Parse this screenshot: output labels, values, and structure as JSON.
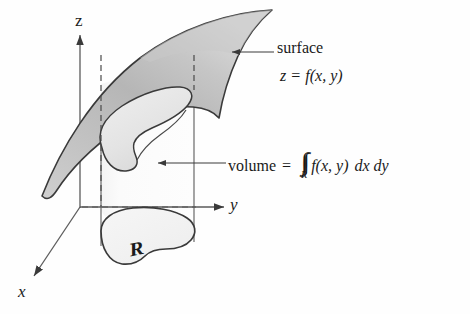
{
  "figure": {
    "axes": {
      "z_label": "z",
      "y_label": "y",
      "x_label": "x"
    },
    "annotations": {
      "surface_line1": "surface",
      "surface_line2_lhs": "z",
      "surface_line2_eq": "=",
      "surface_line2_fn": "f",
      "surface_line2_args": "(x, y)",
      "volume_word": "volume",
      "volume_eq": "=",
      "integral_symbol": "∫∫",
      "integral_subscript": "R",
      "volume_fn": "f",
      "volume_args": "(x, y)",
      "volume_diff": "dx dy",
      "region_label": "R"
    },
    "colors": {
      "surface_fill_light": "#e2e2e2",
      "surface_fill_mid": "#c4c4c4",
      "surface_fill_dark": "#a9a9a9",
      "cylinder_fill": "#fbfbfb",
      "outline": "#3a3a3a",
      "axis": "#4a4a4a",
      "dashed": "#4a4a4a",
      "text": "#1a1a1a",
      "background": "#fefefe"
    },
    "icon_names": {
      "surface_pointer": "arrow-left-icon",
      "volume_pointer": "arrow-left-icon",
      "z_axis_arrow": "arrow-up-icon",
      "y_axis_arrow": "arrow-right-icon",
      "x_axis_arrow": "arrow-down-left-icon"
    }
  }
}
